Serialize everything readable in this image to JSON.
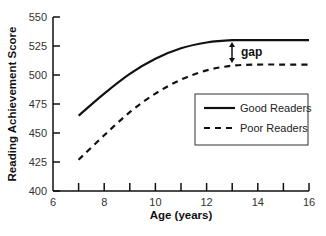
{
  "chart_data": {
    "type": "line",
    "title": "",
    "xlabel": "Age (years)",
    "ylabel": "Reading Achievement Score",
    "xlim": [
      6,
      16
    ],
    "ylim": [
      400,
      550
    ],
    "xticks": [
      6,
      8,
      10,
      12,
      14,
      16
    ],
    "xminor_ticks": [
      7,
      8,
      9,
      10,
      11,
      12,
      13,
      14,
      15,
      16
    ],
    "yticks": [
      400,
      425,
      450,
      475,
      500,
      525,
      550
    ],
    "grid": false,
    "legend_position": "center-right",
    "x": [
      7,
      8,
      9,
      10,
      11,
      12,
      13,
      14,
      15,
      16
    ],
    "series": [
      {
        "name": "Good Readers",
        "style": "solid",
        "values": [
          465,
          484,
          501,
          514,
          523,
          528,
          530,
          530,
          530,
          530
        ]
      },
      {
        "name": "Poor Readers",
        "style": "dashed",
        "values": [
          427,
          448,
          468,
          484,
          496,
          504,
          508,
          509,
          509,
          509
        ]
      }
    ],
    "annotations": [
      {
        "text": "gap",
        "x": 13,
        "from": 508,
        "to": 530,
        "type": "double-arrow"
      }
    ]
  },
  "legend": {
    "items": [
      "Good Readers",
      "Poor Readers"
    ]
  },
  "annotation_label": "gap"
}
